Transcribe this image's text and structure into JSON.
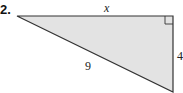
{
  "problem": {
    "number": "2.",
    "figure": "right-triangle",
    "sides": {
      "top": "x",
      "hypotenuse": "9",
      "right": "4"
    },
    "fill_color": "#e3e3e3",
    "stroke_color": "#333333",
    "right_angle_marker": true
  }
}
